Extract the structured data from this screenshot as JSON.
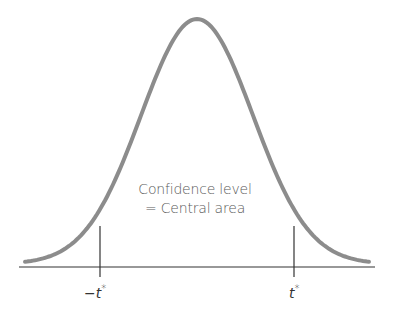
{
  "diagram": {
    "annotation_line1": "Confidence level",
    "annotation_line2": "= Central area",
    "left_tick_label": "−t",
    "left_tick_superscript": "*",
    "right_tick_label": "t",
    "right_tick_superscript": "*",
    "colors": {
      "curve": "#8c8c8c",
      "axis": "#333333",
      "text": "#5a5a5a"
    }
  },
  "chart_data": {
    "type": "line",
    "title": "",
    "x_ticks": [
      "−t*",
      "t*"
    ],
    "annotations": [
      "Confidence level",
      "= Central area"
    ],
    "grid": false,
    "legend": "none"
  }
}
